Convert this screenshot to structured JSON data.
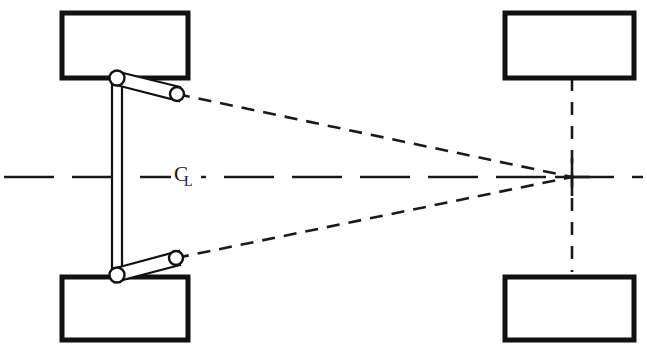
{
  "diagram": {
    "background_color": "#ffffff",
    "line_color": "#111111",
    "canvas": {
      "width": 647,
      "height": 355
    },
    "centerline": {
      "label_c": "C",
      "label_l": "L",
      "label_name": "centerline-symbol",
      "y": 177,
      "x_start": 4,
      "x_end": 643,
      "dash": "50 18"
    },
    "convergence_point": {
      "name": "instant-center",
      "x": 572,
      "y": 177
    },
    "wheels": [
      {
        "name": "front-left-wheel",
        "position": "top-left",
        "x": 62,
        "y": 13,
        "width": 126,
        "height": 65
      },
      {
        "name": "rear-left-wheel",
        "position": "bottom-left",
        "x": 62,
        "y": 277,
        "width": 126,
        "height": 63
      },
      {
        "name": "front-right-wheel",
        "position": "top-right",
        "x": 505,
        "y": 13,
        "width": 129,
        "height": 65
      },
      {
        "name": "rear-right-wheel",
        "position": "bottom-right",
        "x": 505,
        "y": 277,
        "width": 129,
        "height": 63
      }
    ],
    "kingpins": [
      {
        "name": "upper-kingpin-pivot",
        "x": 117,
        "y": 78,
        "r": 7.5
      },
      {
        "name": "lower-kingpin-pivot",
        "x": 117,
        "y": 275,
        "r": 7.5
      }
    ],
    "ball_joints": [
      {
        "name": "upper-tie-rod-ball-joint",
        "x": 177,
        "y": 94,
        "r": 7
      },
      {
        "name": "lower-tie-rod-ball-joint",
        "x": 176,
        "y": 258,
        "r": 7
      }
    ],
    "drag_link": {
      "name": "vertical-drag-link",
      "x1": 112,
      "y1": 80,
      "x2": 112,
      "y2": 273,
      "x3": 122,
      "y3": 273,
      "x4": 122,
      "y4": 80
    },
    "steering_arms": [
      {
        "name": "upper-steering-arm",
        "x1": 117,
        "y1": 78,
        "x2": 177,
        "y2": 94
      },
      {
        "name": "lower-steering-arm",
        "x1": 117,
        "y1": 275,
        "x2": 176,
        "y2": 258
      }
    ],
    "projection_lines": [
      {
        "name": "upper-projection-to-instant-center",
        "x1": 177,
        "y1": 94,
        "x2": 572,
        "y2": 177,
        "dash": "13 9"
      },
      {
        "name": "lower-projection-to-instant-center",
        "x1": 176,
        "y1": 258,
        "x2": 572,
        "y2": 177,
        "dash": "13 9"
      }
    ],
    "rear_axle_line": {
      "name": "rear-axle-vertical-dashed",
      "x": 572,
      "y1": 78,
      "y2": 272,
      "dash": "13 11"
    },
    "cross_mark": {
      "name": "instant-center-cross",
      "x": 572,
      "y": 177,
      "half_h": 17,
      "half_v": 19
    }
  }
}
